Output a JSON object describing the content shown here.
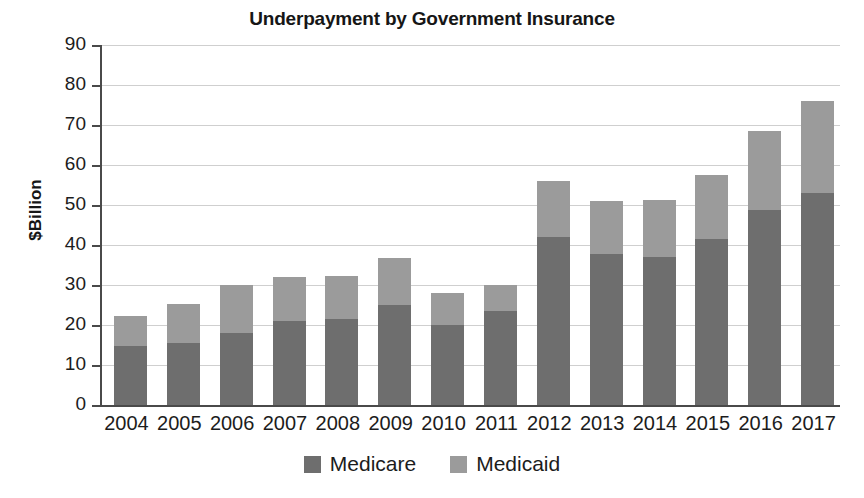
{
  "chart_data": {
    "type": "bar",
    "stacked": true,
    "title": "Underpayment by Government Insurance",
    "xlabel": "",
    "ylabel": "$Billion",
    "ylim": [
      0,
      90
    ],
    "ytick_step": 10,
    "yticks": [
      0,
      10,
      20,
      30,
      40,
      50,
      60,
      70,
      80,
      90
    ],
    "grid": true,
    "legend_position": "bottom",
    "categories": [
      "2004",
      "2005",
      "2006",
      "2007",
      "2008",
      "2009",
      "2010",
      "2011",
      "2012",
      "2013",
      "2014",
      "2015",
      "2016",
      "2017"
    ],
    "series": [
      {
        "name": "Medicare",
        "color": "#6e6e6e",
        "values": [
          14.8,
          15.5,
          18.0,
          21.0,
          21.5,
          25.0,
          20.0,
          23.5,
          42.0,
          37.7,
          36.9,
          41.4,
          48.7,
          53.0
        ]
      },
      {
        "name": "Medicaid",
        "color": "#9b9b9b",
        "values": [
          7.4,
          9.8,
          12.0,
          11.0,
          10.8,
          11.8,
          8.0,
          6.5,
          14.0,
          13.3,
          14.4,
          16.1,
          19.8,
          23.0
        ]
      }
    ],
    "totals": [
      22.2,
      25.3,
      30.0,
      32.0,
      32.3,
      36.8,
      28.0,
      30.0,
      56.0,
      51.0,
      51.3,
      57.5,
      68.5,
      76.0
    ]
  },
  "legend": {
    "items": [
      {
        "label": "Medicare",
        "color": "#6e6e6e",
        "swatch_name": "legend-swatch-medicare"
      },
      {
        "label": "Medicaid",
        "color": "#9b9b9b",
        "swatch_name": "legend-swatch-medicaid"
      }
    ]
  }
}
